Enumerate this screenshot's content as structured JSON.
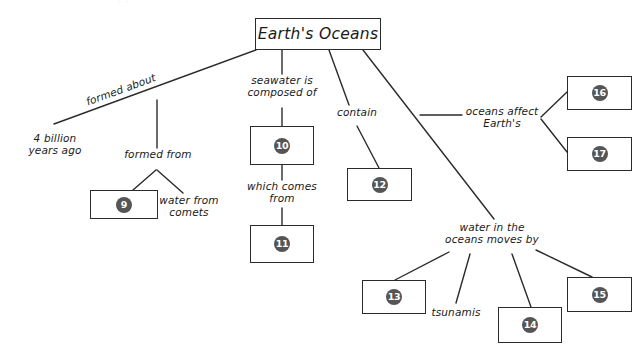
{
  "diagram": {
    "type": "concept-map",
    "topic": "Earth's Oceans",
    "root": {
      "label": "Earth's Oceans"
    },
    "ink_color": "#2b2b2b",
    "blank_circle_color": "#555555",
    "background": "#ffffff",
    "top_artifact": "· ·",
    "link_labels": [
      {
        "id": "formed-about",
        "text": "formed about"
      },
      {
        "id": "four-billion",
        "text": "4 billion\nyears ago"
      },
      {
        "id": "formed-from",
        "text": "formed from"
      },
      {
        "id": "water-from-comets",
        "text": "water from\ncomets"
      },
      {
        "id": "seawater-composed",
        "text": "seawater is\ncomposed of"
      },
      {
        "id": "which-comes-from",
        "text": "which comes\nfrom"
      },
      {
        "id": "contain",
        "text": "contain"
      },
      {
        "id": "oceans-affect",
        "text": "oceans affect\nEarth's"
      },
      {
        "id": "water-moves-by",
        "text": "water in the\noceans moves by"
      },
      {
        "id": "tsunamis",
        "text": "tsunamis"
      }
    ],
    "blanks": [
      {
        "id": "blank-9",
        "number": "9"
      },
      {
        "id": "blank-10",
        "number": "10"
      },
      {
        "id": "blank-11",
        "number": "11"
      },
      {
        "id": "blank-12",
        "number": "12"
      },
      {
        "id": "blank-13",
        "number": "13"
      },
      {
        "id": "blank-14",
        "number": "14"
      },
      {
        "id": "blank-15",
        "number": "15"
      },
      {
        "id": "blank-16",
        "number": "16"
      },
      {
        "id": "blank-17",
        "number": "17"
      }
    ]
  }
}
